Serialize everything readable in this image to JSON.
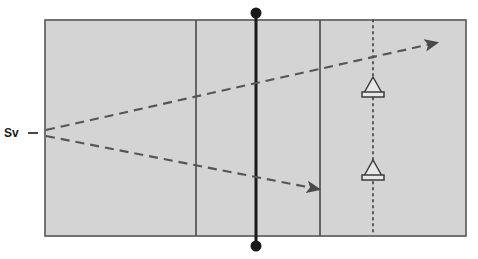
{
  "diagram": {
    "labels": {
      "source_label": "Sv",
      "source_leader": "-"
    },
    "colors": {
      "panel_fill": "#d4d4d4",
      "panel_stroke": "#555555",
      "divider_stroke": "#4a4a4a",
      "thick_line": "#1a1a1a",
      "dashed_ray": "#555555",
      "dotted_line": "#4d4d4d",
      "receiver_stroke": "#3b3b3b",
      "receiver_fill": "#e8e8e8",
      "node_dot": "#1a1a1a",
      "background": "#ffffff",
      "text": "#1a1a1a"
    },
    "panel": {
      "x": 45,
      "y": 20,
      "width": 421,
      "height": 216
    },
    "dividers": [
      {
        "name": "divider-left",
        "x": 196
      },
      {
        "name": "divider-right",
        "x": 320
      }
    ],
    "center_line": {
      "name": "center-line",
      "x": 256,
      "y_top": 13,
      "y_bottom": 246
    },
    "end_nodes": [
      {
        "name": "node-top",
        "cx": 256,
        "cy": 13,
        "r": 5.5
      },
      {
        "name": "node-bottom",
        "cx": 256,
        "cy": 246,
        "r": 5.5
      }
    ],
    "dotted_line": {
      "name": "dotted-survey-line",
      "x": 373,
      "y_top": 20,
      "y_bottom": 236
    },
    "source_point": {
      "x": 46,
      "y": 133
    },
    "rays": [
      {
        "name": "ray-upper",
        "x1": 46,
        "y1": 130,
        "x2": 440,
        "y2": 42
      },
      {
        "name": "ray-lower",
        "x1": 46,
        "y1": 136,
        "x2": 322,
        "y2": 190
      }
    ],
    "receivers": [
      {
        "name": "receiver-upper",
        "cx": 373,
        "cy": 85
      },
      {
        "name": "receiver-lower",
        "cx": 373,
        "cy": 168
      }
    ]
  }
}
